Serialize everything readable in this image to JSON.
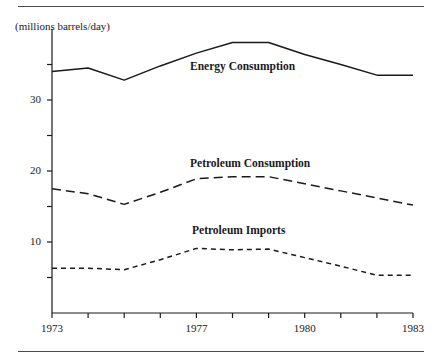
{
  "figure": {
    "unit_label": "(millions barrels/day)",
    "rule_color": "#4a4a4a"
  },
  "chart_data": {
    "type": "line",
    "title": "",
    "subtitle": "",
    "xlabel": "",
    "ylabel": "(millions barrels/day)",
    "xlim": [
      1973,
      1983
    ],
    "ylim": [
      0,
      40
    ],
    "grid": false,
    "legend_position": "inline-annotations",
    "x": [
      1973,
      1974,
      1975,
      1976,
      1977,
      1978,
      1979,
      1980,
      1981,
      1982,
      1983
    ],
    "x_tick_values": [
      1973,
      1974,
      1975,
      1976,
      1977,
      1978,
      1979,
      1980,
      1981,
      1982,
      1983
    ],
    "x_tick_labels": [
      "1973",
      "",
      "",
      "",
      "1977",
      "",
      "",
      "1980",
      "",
      "",
      "1983"
    ],
    "y_tick_values": [
      5,
      10,
      15,
      20,
      25,
      30,
      35
    ],
    "y_tick_labels": [
      "",
      "10",
      "",
      "20",
      "",
      "30",
      ""
    ],
    "series": [
      {
        "name": "Energy Consumption",
        "style": "solid",
        "color": "#1a1a1a",
        "values": [
          34.0,
          34.5,
          32.8,
          34.8,
          36.6,
          38.1,
          38.1,
          36.4,
          35.0,
          33.5,
          33.5
        ]
      },
      {
        "name": "Petroleum Consumption",
        "style": "long-dash",
        "color": "#1a1a1a",
        "values": [
          17.5,
          16.8,
          15.3,
          17.0,
          18.9,
          19.2,
          19.2,
          18.2,
          17.2,
          16.2,
          15.2
        ]
      },
      {
        "name": "Petroleum Imports",
        "style": "short-dash",
        "color": "#1a1a1a",
        "values": [
          6.3,
          6.3,
          6.1,
          7.5,
          9.1,
          8.9,
          9.0,
          7.8,
          6.6,
          5.3,
          5.3
        ]
      }
    ]
  }
}
